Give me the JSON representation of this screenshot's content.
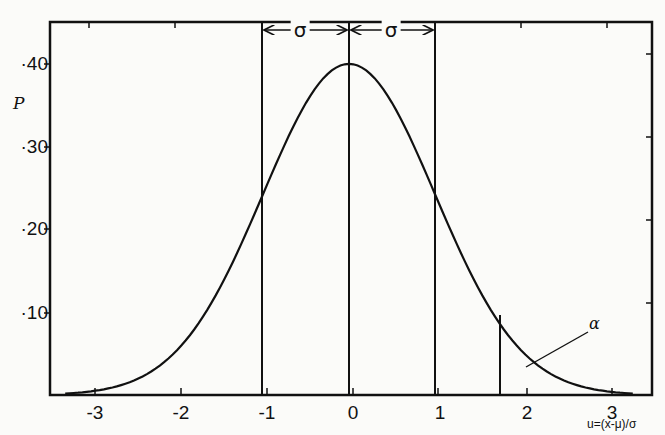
{
  "chart_data": {
    "type": "line",
    "title": "",
    "xlabel": "u=(x-μ)/σ",
    "ylabel": "P",
    "xlim": [
      -3.5,
      3.5
    ],
    "ylim": [
      0,
      0.45
    ],
    "grid": false,
    "legend": null,
    "x_ticks": [
      -3,
      -2,
      -1,
      0,
      1,
      2,
      3
    ],
    "x_tick_labels": [
      "-3",
      "-2",
      "-1",
      "0",
      "1",
      "2",
      "3"
    ],
    "y_ticks": [
      0.1,
      0.2,
      0.3,
      0.4
    ],
    "y_tick_labels": [
      "·10",
      "·20",
      "·30",
      "·40"
    ],
    "series": [
      {
        "name": "standard normal density",
        "x": [
          -3.5,
          -3,
          -2.5,
          -2,
          -1.5,
          -1,
          -0.5,
          0,
          0.5,
          1,
          1.5,
          2,
          2.5,
          3,
          3.3
        ],
        "values": [
          0.001,
          0.004,
          0.018,
          0.054,
          0.13,
          0.242,
          0.352,
          0.399,
          0.352,
          0.242,
          0.13,
          0.054,
          0.018,
          0.004,
          0.002
        ]
      }
    ],
    "vertical_lines": [
      {
        "x": -1,
        "extent": "full"
      },
      {
        "x": 0,
        "extent": "full"
      },
      {
        "x": 1,
        "extent": "full"
      },
      {
        "x": 1.65,
        "extent": "to-curve"
      }
    ],
    "annotations": [
      {
        "text": "σ",
        "type": "double-arrow",
        "from": -1,
        "to": 0
      },
      {
        "text": "σ",
        "type": "double-arrow",
        "from": 0,
        "to": 1
      },
      {
        "text": "α",
        "type": "leader-line",
        "points_to": "upper tail area beyond u≈1.65"
      }
    ]
  },
  "labels": {
    "y_axis": "P",
    "x_axis": "u=(x-μ)/σ",
    "sigma_left": "σ",
    "sigma_right": "σ",
    "alpha": "α",
    "y_ticks": [
      "·40",
      "·30",
      "·20",
      "·10"
    ],
    "x_ticks": [
      "-3",
      "-2",
      "-1",
      "0",
      "1",
      "2",
      "3"
    ]
  }
}
